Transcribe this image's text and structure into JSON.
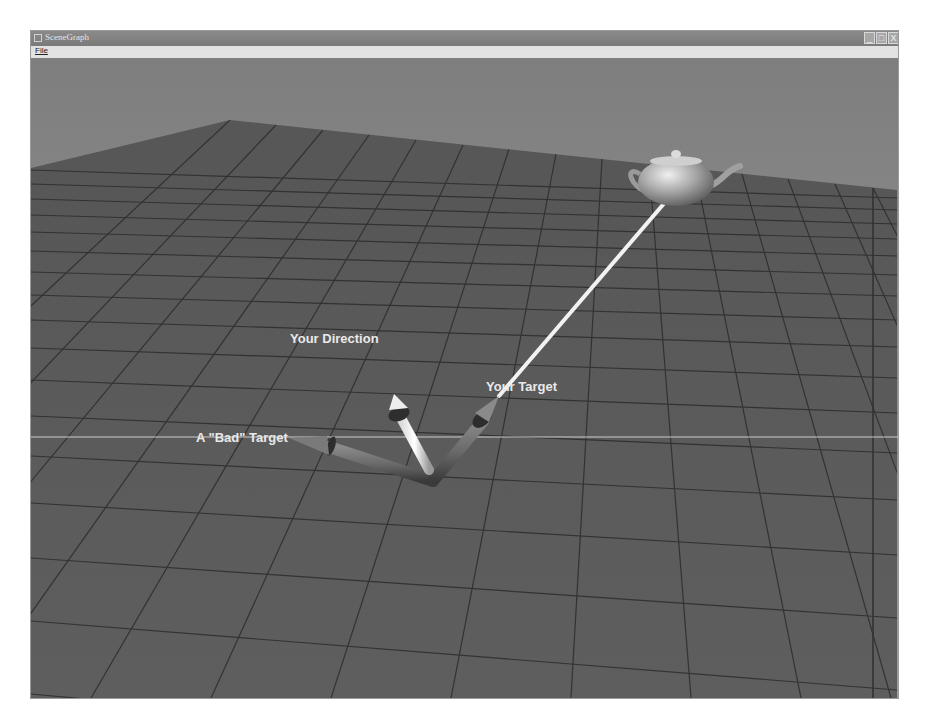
{
  "window": {
    "title": "SceneGraph",
    "controls": {
      "minimize": "_",
      "maximize": "□",
      "close": "X"
    }
  },
  "menu": {
    "items": [
      {
        "label": "File"
      }
    ]
  },
  "scene": {
    "labels": {
      "direction": "Your Direction",
      "target": "Your Target",
      "bad_target": "A \"Bad\" Target"
    },
    "objects": [
      "teapot",
      "grid-floor",
      "direction-arrow",
      "target-arrow",
      "bad-target-arrow",
      "target-line",
      "horizon-line"
    ],
    "colors": {
      "sky_top": "#7c7c7c",
      "sky_bottom": "#9a9a9a",
      "floor": "#5b5b5b",
      "grid_line": "#2c2c2c",
      "label_text": "#e9e9e9",
      "target_line": "#f2f2f2"
    }
  }
}
